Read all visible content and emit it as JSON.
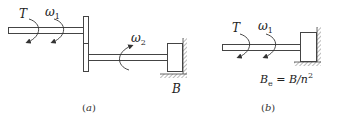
{
  "diagram": {
    "stroke_color": "#444444",
    "background": "#ffffff",
    "panel_a": {
      "caption": "(a)",
      "caption_letter": "a",
      "torque_label": "T",
      "omega1_symbol": "ω",
      "omega1_sub": "1",
      "omega2_symbol": "ω",
      "omega2_sub": "2",
      "damper_label": "B"
    },
    "panel_b": {
      "caption_letter": "b",
      "torque_label": "T",
      "omega1_symbol": "ω",
      "omega1_sub": "1",
      "damper_label_main": "B",
      "damper_label_sub": "e",
      "damper_label_eq": " = B/n",
      "damper_label_sup": "2"
    }
  }
}
